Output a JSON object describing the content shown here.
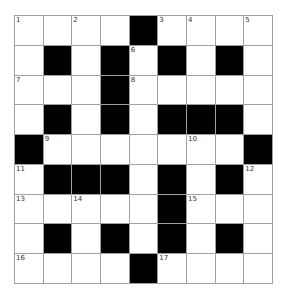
{
  "puzzle": {
    "rows": 9,
    "cols": 9,
    "colors": {
      "block": "#000000",
      "empty": "#ffffff",
      "gridline": "#a0a0a0",
      "number": "#333333"
    },
    "grid": [
      [
        {
          "b": 0,
          "n": "1"
        },
        {
          "b": 0,
          "n": ""
        },
        {
          "b": 0,
          "n": "2"
        },
        {
          "b": 0,
          "n": ""
        },
        {
          "b": 1,
          "n": ""
        },
        {
          "b": 0,
          "n": "3"
        },
        {
          "b": 0,
          "n": "4"
        },
        {
          "b": 0,
          "n": ""
        },
        {
          "b": 0,
          "n": "5"
        }
      ],
      [
        {
          "b": 0,
          "n": ""
        },
        {
          "b": 1,
          "n": ""
        },
        {
          "b": 0,
          "n": ""
        },
        {
          "b": 1,
          "n": ""
        },
        {
          "b": 0,
          "n": "6"
        },
        {
          "b": 1,
          "n": ""
        },
        {
          "b": 0,
          "n": ""
        },
        {
          "b": 1,
          "n": ""
        },
        {
          "b": 0,
          "n": ""
        }
      ],
      [
        {
          "b": 0,
          "n": "7"
        },
        {
          "b": 0,
          "n": ""
        },
        {
          "b": 0,
          "n": ""
        },
        {
          "b": 1,
          "n": ""
        },
        {
          "b": 0,
          "n": "8"
        },
        {
          "b": 0,
          "n": ""
        },
        {
          "b": 0,
          "n": ""
        },
        {
          "b": 0,
          "n": ""
        },
        {
          "b": 0,
          "n": ""
        }
      ],
      [
        {
          "b": 0,
          "n": ""
        },
        {
          "b": 1,
          "n": ""
        },
        {
          "b": 0,
          "n": ""
        },
        {
          "b": 1,
          "n": ""
        },
        {
          "b": 0,
          "n": ""
        },
        {
          "b": 1,
          "n": ""
        },
        {
          "b": 1,
          "n": ""
        },
        {
          "b": 1,
          "n": ""
        },
        {
          "b": 0,
          "n": ""
        }
      ],
      [
        {
          "b": 1,
          "n": ""
        },
        {
          "b": 0,
          "n": "9"
        },
        {
          "b": 0,
          "n": ""
        },
        {
          "b": 0,
          "n": ""
        },
        {
          "b": 0,
          "n": ""
        },
        {
          "b": 0,
          "n": ""
        },
        {
          "b": 0,
          "n": "10"
        },
        {
          "b": 0,
          "n": ""
        },
        {
          "b": 1,
          "n": ""
        }
      ],
      [
        {
          "b": 0,
          "n": "11"
        },
        {
          "b": 1,
          "n": ""
        },
        {
          "b": 1,
          "n": ""
        },
        {
          "b": 1,
          "n": ""
        },
        {
          "b": 0,
          "n": ""
        },
        {
          "b": 1,
          "n": ""
        },
        {
          "b": 0,
          "n": ""
        },
        {
          "b": 1,
          "n": ""
        },
        {
          "b": 0,
          "n": "12"
        }
      ],
      [
        {
          "b": 0,
          "n": "13"
        },
        {
          "b": 0,
          "n": ""
        },
        {
          "b": 0,
          "n": "14"
        },
        {
          "b": 0,
          "n": ""
        },
        {
          "b": 0,
          "n": ""
        },
        {
          "b": 1,
          "n": ""
        },
        {
          "b": 0,
          "n": "15"
        },
        {
          "b": 0,
          "n": ""
        },
        {
          "b": 0,
          "n": ""
        }
      ],
      [
        {
          "b": 0,
          "n": ""
        },
        {
          "b": 1,
          "n": ""
        },
        {
          "b": 0,
          "n": ""
        },
        {
          "b": 1,
          "n": ""
        },
        {
          "b": 0,
          "n": ""
        },
        {
          "b": 1,
          "n": ""
        },
        {
          "b": 0,
          "n": ""
        },
        {
          "b": 1,
          "n": ""
        },
        {
          "b": 0,
          "n": ""
        }
      ],
      [
        {
          "b": 0,
          "n": "16"
        },
        {
          "b": 0,
          "n": ""
        },
        {
          "b": 0,
          "n": ""
        },
        {
          "b": 0,
          "n": ""
        },
        {
          "b": 1,
          "n": ""
        },
        {
          "b": 0,
          "n": "17"
        },
        {
          "b": 0,
          "n": ""
        },
        {
          "b": 0,
          "n": ""
        },
        {
          "b": 0,
          "n": ""
        }
      ]
    ]
  }
}
